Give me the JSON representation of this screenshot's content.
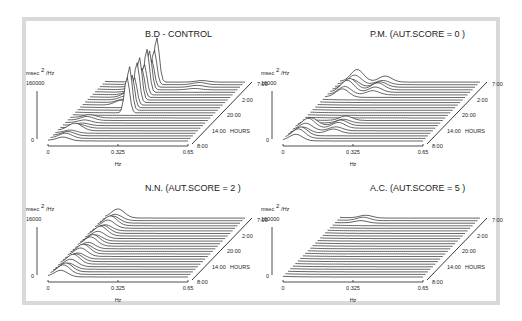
{
  "chart_data": [
    {
      "type": "waterfall",
      "title": "B.D - CONTROL",
      "ylabel": "msec² /Hz",
      "ymax_label": "160000",
      "ymin_label": "0",
      "xlabel": "Hz",
      "xticks": [
        "0",
        "0.325",
        "0.65"
      ],
      "xlim": [
        0,
        0.65
      ],
      "zlabel": "HOURS",
      "zticks": [
        "8:00",
        "14:00",
        "20:00",
        "2:00",
        "7:00"
      ],
      "traces": 24,
      "peaks": [
        {
          "freq": 0.07,
          "amp": 0.18,
          "from": 0,
          "to": 4
        },
        {
          "freq": 0.09,
          "amp": 0.14,
          "from": 4,
          "to": 9
        },
        {
          "freq": 0.24,
          "amp": 1.6,
          "from": 11,
          "to": 23
        },
        {
          "freq": 0.18,
          "amp": 0.2,
          "from": 14,
          "to": 23
        },
        {
          "freq": 0.45,
          "amp": 0.08,
          "from": 20,
          "to": 23
        }
      ]
    },
    {
      "type": "waterfall",
      "title": "P.M.  (AUT.SCORE = 0 )",
      "ylabel": "msec² /Hz",
      "ymax_label": "16000",
      "ymin_label": "0",
      "xlabel": "Hz",
      "xticks": [
        "0",
        "0.325",
        "0.65"
      ],
      "xlim": [
        0,
        0.65
      ],
      "zlabel": "HOURS",
      "zticks": [
        "8:00",
        "14:00",
        "20:00",
        "2:00",
        "7:00"
      ],
      "traces": 24,
      "peaks": [
        {
          "freq": 0.06,
          "amp": 0.35,
          "from": 0,
          "to": 6
        },
        {
          "freq": 0.2,
          "amp": 0.22,
          "from": 3,
          "to": 8
        },
        {
          "freq": 0.08,
          "amp": 0.45,
          "from": 17,
          "to": 23
        },
        {
          "freq": 0.21,
          "amp": 0.25,
          "from": 18,
          "to": 23
        }
      ]
    },
    {
      "type": "waterfall",
      "title": "N.N.  (AUT.SCORE = 2 )",
      "ylabel": "msec² /Hz",
      "ymax_label": "16000",
      "ymin_label": "0",
      "xlabel": "Hz",
      "xticks": [
        "0",
        "0.325",
        "0.65"
      ],
      "xlim": [
        0,
        0.65
      ],
      "zlabel": "HOURS",
      "zticks": [
        "8:00",
        "14:00",
        "20:00",
        "2:00",
        "7:00"
      ],
      "traces": 24,
      "peaks": [
        {
          "freq": 0.06,
          "amp": 0.35,
          "from": 0,
          "to": 23
        }
      ]
    },
    {
      "type": "waterfall",
      "title": "A.C.  (AUT.SCORE = 5 )",
      "ylabel": "msec² /Hz",
      "ymax_label": "160000",
      "ymin_label": "0",
      "xlabel": "Hz",
      "xticks": [
        "0",
        "0.325",
        "0.65"
      ],
      "xlim": [
        0,
        0.65
      ],
      "zlabel": "HOURS",
      "zticks": [
        "8:00",
        "14:00",
        "20:00",
        "2:00",
        "7:00"
      ],
      "traces": 24,
      "peaks": [
        {
          "freq": 0.12,
          "amp": 0.12,
          "from": 21,
          "to": 23
        }
      ]
    }
  ]
}
